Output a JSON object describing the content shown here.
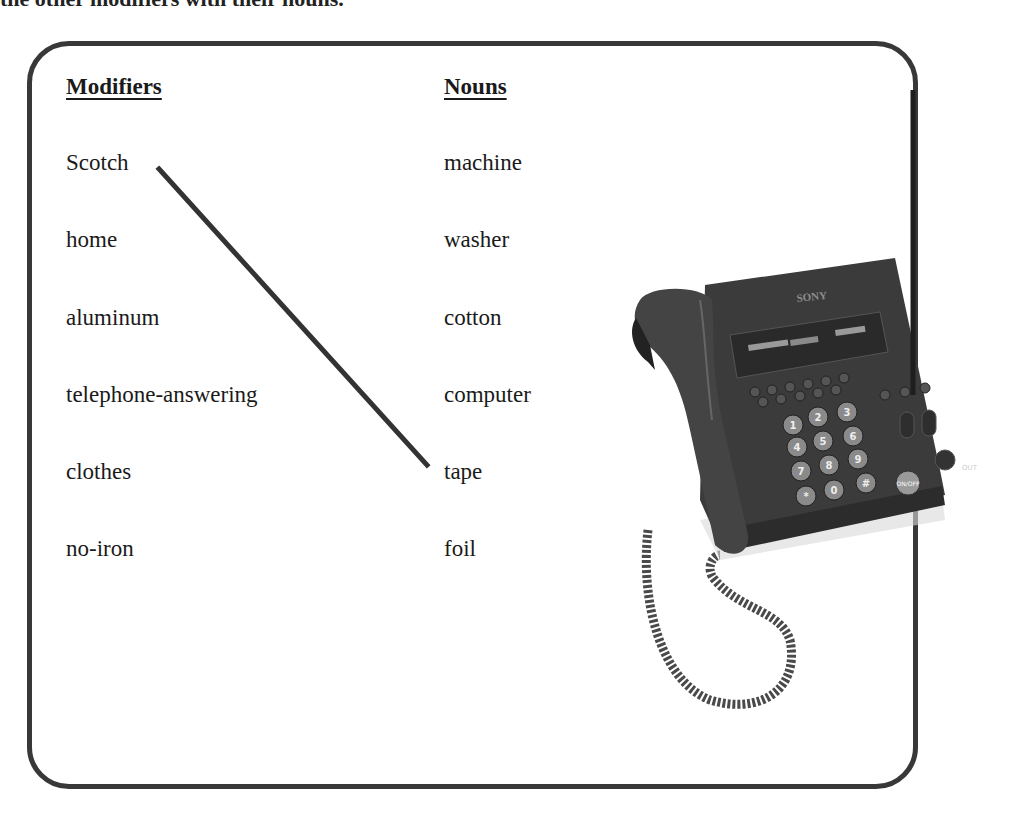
{
  "instructions_partial": "the other modifiers with their nouns.",
  "exercise": {
    "columns": {
      "modifiers_heading": "Modifiers",
      "nouns_heading": "Nouns"
    },
    "modifiers": [
      "Scotch",
      "home",
      "aluminum",
      "telephone-answering",
      "clothes",
      "no-iron"
    ],
    "nouns": [
      "machine",
      "washer",
      "cotton",
      "computer",
      "tape",
      "foil"
    ],
    "example_match": {
      "modifier": "Scotch",
      "noun": "tape"
    }
  },
  "illustration": {
    "subject": "telephone-answering machine",
    "brand_label": "SONY",
    "keypad": [
      "1",
      "2",
      "3",
      "4",
      "5",
      "6",
      "7",
      "8",
      "9",
      "*",
      "0",
      "#"
    ],
    "button_labels": [
      "ON/OFF",
      "OUT"
    ]
  },
  "colors": {
    "border": "#383838",
    "text": "#1a1a1a",
    "phone_body": "#3a3a3a"
  }
}
